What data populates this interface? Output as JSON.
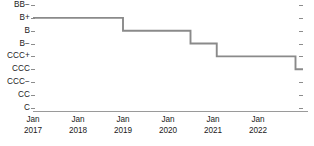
{
  "chart_data": {
    "type": "line",
    "title": "",
    "subtitle": "",
    "xlabel": "",
    "ylabel": "",
    "legend": [],
    "legend_position": "none",
    "grid": false,
    "line_style": "step-post",
    "line_color": "#8a8a8a",
    "axis_color": "#9a9a9a",
    "text_color": "#1a1a1a",
    "y_categories": [
      "BB−",
      "B+",
      "B",
      "B−",
      "CCC+",
      "CCC",
      "CCC−",
      "CC",
      "C"
    ],
    "y_axis_type": "ordinal-credit-rating",
    "ylim": [
      "BB−",
      "C"
    ],
    "x_tick_labels": [
      {
        "month": "Jan",
        "year": "2017"
      },
      {
        "month": "Jan",
        "year": "2018"
      },
      {
        "month": "Jan",
        "year": "2019"
      },
      {
        "month": "Jan",
        "year": "2020"
      },
      {
        "month": "Jan",
        "year": "2021"
      },
      {
        "month": "Jan",
        "year": "2022"
      }
    ],
    "xlim": [
      "Jan 2017",
      "Jan 2023"
    ],
    "series": [
      {
        "name": "Credit rating",
        "points": [
          {
            "x": "Jan 2017",
            "y": "B+"
          },
          {
            "x": "Jan 2019",
            "y": "B"
          },
          {
            "x": "Jul 2020",
            "y": "B−"
          },
          {
            "x": "Feb 2021",
            "y": "CCC+"
          },
          {
            "x": "Nov 2022",
            "y": "CCC"
          },
          {
            "x": "Jan 2023",
            "y": "CCC"
          }
        ]
      }
    ],
    "annotations": []
  }
}
